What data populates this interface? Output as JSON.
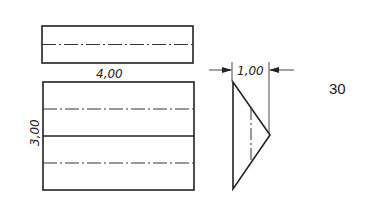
{
  "drawing": {
    "top_view": {
      "label": "top-rectangle"
    },
    "front_view": {
      "label": "front-rectangle"
    },
    "side_view": {
      "label": "triangular-prism-side"
    },
    "dimensions": {
      "width": "4,00",
      "height": "3,00",
      "depth": "1,00"
    },
    "figure_number": "30",
    "colors": {
      "line": "#222222",
      "background": "#ffffff"
    }
  }
}
